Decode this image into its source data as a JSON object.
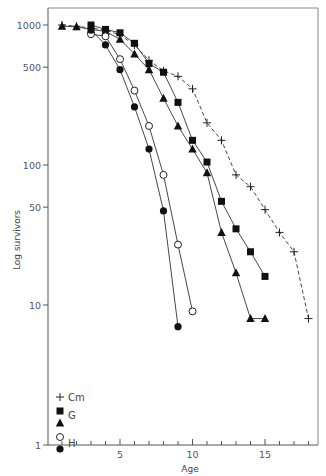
{
  "chart_data": {
    "type": "line",
    "title": "",
    "xlabel": "Age",
    "ylabel": "Log survivors",
    "yscale": "log",
    "xlim": [
      0,
      18.5
    ],
    "ylim": [
      1,
      1000
    ],
    "xticks": [
      5,
      10,
      15
    ],
    "yticks": [
      1,
      10,
      50,
      100,
      500,
      1000
    ],
    "ytick_labels": [
      "1",
      "10",
      "50",
      "100",
      "500",
      "1000"
    ],
    "xtick_labels": [
      "5",
      "10",
      "15"
    ],
    "grid": false,
    "legend_position": "lower-left",
    "legend": [
      {
        "marker": "plus",
        "label": "Cm"
      },
      {
        "marker": "filled-square",
        "label": "G"
      },
      {
        "marker": "filled-triangle",
        "label": ""
      },
      {
        "marker": "open-circle",
        "label": "H"
      },
      {
        "marker": "filled-circle",
        "label": ""
      }
    ],
    "series": [
      {
        "name": "Cm",
        "marker": "plus",
        "line": "dashed",
        "x": [
          1,
          2,
          3,
          4,
          5,
          6,
          7,
          8,
          9,
          10,
          11,
          12,
          13,
          14,
          15,
          16,
          17,
          18
        ],
        "values": [
          1000,
          980,
          950,
          920,
          850,
          720,
          560,
          470,
          430,
          350,
          200,
          150,
          85,
          70,
          48,
          33,
          24,
          8
        ]
      },
      {
        "name": "G (square)",
        "marker": "filled-square",
        "line": "solid",
        "x": [
          3,
          4,
          5,
          6,
          7,
          8,
          9,
          10,
          11,
          12,
          13,
          14,
          15
        ],
        "values": [
          1000,
          930,
          880,
          740,
          530,
          460,
          280,
          150,
          105,
          55,
          35,
          24,
          16
        ]
      },
      {
        "name": "G (triangle)",
        "marker": "filled-triangle",
        "line": "solid",
        "x": [
          1,
          2,
          3,
          4,
          5,
          6,
          7,
          8,
          9,
          10,
          11,
          12,
          13,
          14,
          15
        ],
        "values": [
          980,
          970,
          930,
          900,
          790,
          620,
          480,
          300,
          190,
          130,
          88,
          33,
          17,
          8,
          8
        ]
      },
      {
        "name": "H (open circle)",
        "marker": "open-circle",
        "line": "solid",
        "x": [
          3,
          4,
          5,
          6,
          7,
          8,
          9,
          10
        ],
        "values": [
          860,
          830,
          570,
          340,
          190,
          85,
          27,
          9
        ]
      },
      {
        "name": "H (filled circle)",
        "marker": "filled-circle",
        "line": "solid",
        "x": [
          3,
          4,
          5,
          6,
          7,
          8,
          9
        ],
        "values": [
          920,
          720,
          480,
          260,
          130,
          47,
          7
        ]
      }
    ]
  }
}
